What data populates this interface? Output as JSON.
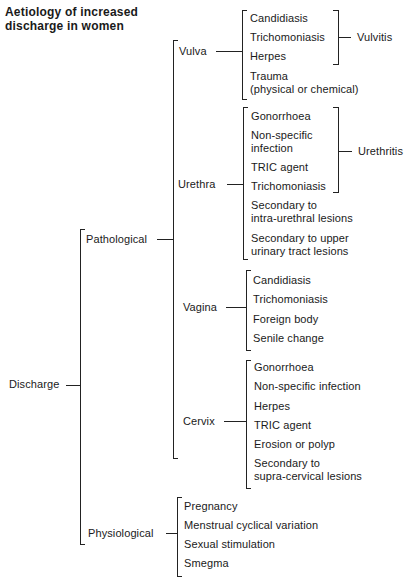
{
  "title": {
    "line1": "Aetiology of increased",
    "line2": "discharge in women"
  },
  "root": {
    "label": "Discharge"
  },
  "pathological": {
    "label": "Pathological",
    "sites": {
      "vulva": {
        "label": "Vulva",
        "items": [
          "Candidiasis",
          "Trichomoniasis",
          "Herpes",
          "Trauma",
          "(physical or chemical)"
        ],
        "group_label": "Vulvitis"
      },
      "urethra": {
        "label": "Urethra",
        "items": [
          "Gonorrhoea",
          "Non-specific",
          "infection",
          "TRIC agent",
          "Trichomoniasis",
          "Secondary to",
          "intra-urethral lesions",
          "Secondary to upper",
          "urinary tract lesions"
        ],
        "group_label": "Urethritis"
      },
      "vagina": {
        "label": "Vagina",
        "items": [
          "Candidiasis",
          "Trichomoniasis",
          "Foreign body",
          "Senile change"
        ]
      },
      "cervix": {
        "label": "Cervix",
        "items": [
          "Gonorrhoea",
          "Non-specific infection",
          "Herpes",
          "TRIC agent",
          "Erosion or polyp",
          "Secondary to",
          "supra-cervical lesions"
        ]
      }
    }
  },
  "physiological": {
    "label": "Physiological",
    "items": [
      "Pregnancy",
      "Menstrual cyclical variation",
      "Sexual stimulation",
      "Smegma"
    ]
  }
}
